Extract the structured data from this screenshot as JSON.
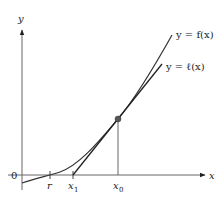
{
  "diagram": {
    "axes": {
      "x_label": "x",
      "y_label": "y",
      "origin_label": "0"
    },
    "ticks": [
      {
        "name": "r",
        "label": "r",
        "subscript": ""
      },
      {
        "name": "x1",
        "label": "x",
        "subscript": "1"
      },
      {
        "name": "x0",
        "label": "x",
        "subscript": "0"
      }
    ],
    "curves": [
      {
        "name": "f",
        "label": "y = f(x)"
      },
      {
        "name": "tangent",
        "label": "y = ℓ(x)"
      }
    ],
    "point": {
      "name": "tangency-point",
      "at": "x0"
    },
    "colors": {
      "axis": "#555555",
      "curve": "#333333",
      "point": "#555555",
      "text": "#222222"
    }
  }
}
